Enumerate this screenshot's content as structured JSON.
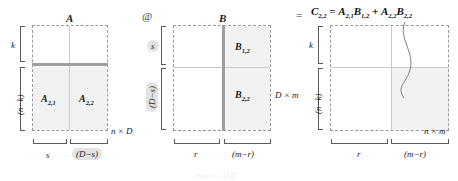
{
  "figure": {
    "title_caption": "Figure 1: 计算",
    "operator_at": "@",
    "operator_equals": "=",
    "formula": {
      "lhs": "C",
      "lhs_sub": "2,2",
      "eq": "=",
      "t1_a": "A",
      "t1_a_sub": "2,1",
      "t1_b": "B",
      "t1_b_sub": "1,2",
      "plus": "+",
      "t2_a": "A",
      "t2_a_sub": "2,2",
      "t2_b": "B",
      "t2_b_sub": "2,2"
    }
  },
  "matrix_a": {
    "name": "A",
    "size_label": "n × D",
    "blocks": [
      {
        "name": "A",
        "sub": "2,1"
      },
      {
        "name": "A",
        "sub": "2,2"
      }
    ],
    "row_dims": [
      {
        "text": "k",
        "highlight": false
      },
      {
        "text": "(n−k)",
        "highlight": false
      }
    ],
    "col_dims": [
      {
        "text": "s",
        "highlight": false
      },
      {
        "text": "(D−s)",
        "highlight": true
      }
    ]
  },
  "matrix_b": {
    "name": "B",
    "size_label": "D × m",
    "blocks": [
      {
        "name": "B",
        "sub": "1,2"
      },
      {
        "name": "B",
        "sub": "2,2"
      }
    ],
    "row_dims": [
      {
        "text": "s",
        "highlight": true
      },
      {
        "text": "(D−s)",
        "highlight": true
      }
    ],
    "col_dims": [
      {
        "text": "r",
        "highlight": false
      },
      {
        "text": "(m−r)",
        "highlight": false
      }
    ]
  },
  "matrix_c": {
    "name": "",
    "size_label": "n × m",
    "row_dims": [
      {
        "text": "k",
        "highlight": false
      },
      {
        "text": "(n−k)",
        "highlight": false
      }
    ],
    "col_dims": [
      {
        "text": "r",
        "highlight": false
      },
      {
        "text": "(m−r)",
        "highlight": false
      }
    ]
  },
  "colors": {
    "dashed_border": "#9a9a9a",
    "fill_light": "#f2f2f2",
    "fill_mid": "#e6e6e6",
    "bar": "#9e9e9e",
    "pill": "#e3e3e3"
  }
}
